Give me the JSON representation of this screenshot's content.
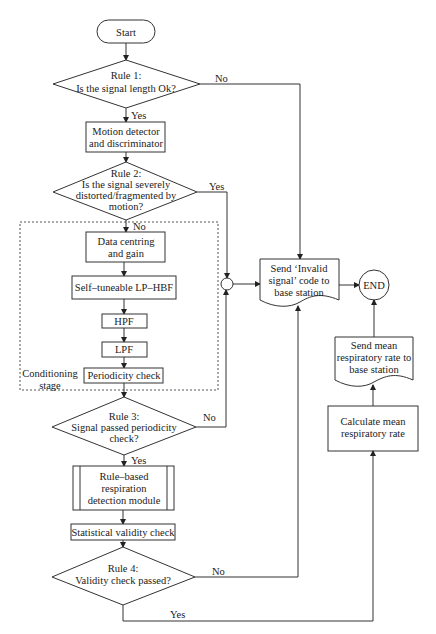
{
  "flowchart": {
    "start": {
      "label": "Start"
    },
    "rule1": {
      "title": "Rule 1:",
      "question": "Is the signal length Ok?",
      "yes": "Yes",
      "no": "No"
    },
    "motion": {
      "line1": "Motion detector",
      "line2": "and discriminator"
    },
    "rule2": {
      "title": "Rule 2:",
      "line1": "Is the signal severely",
      "line2": "distorted/fragmented by",
      "line3": "motion?",
      "yes": "Yes",
      "no": "No"
    },
    "conditioning": {
      "label_line1": "Conditioning",
      "label_line2": "stage",
      "centring": {
        "line1": "Data centring",
        "line2": "and gain"
      },
      "lphbf": "Self–tuneable LP–HBF",
      "hpf": "HPF",
      "lpf": "LPF",
      "periodicity": "Periodicity check"
    },
    "rule3": {
      "title": "Rule 3:",
      "line1": "Signal passed periodicity",
      "line2": "check?",
      "yes": "Yes",
      "no": "No"
    },
    "module": {
      "line1": "Rule–based",
      "line2": "respiration",
      "line3": "detection module"
    },
    "stat_check": "Statistical validity check",
    "rule4": {
      "title": "Rule 4:",
      "question": "Validity check passed?",
      "yes": "Yes",
      "no": "No"
    },
    "invalid": {
      "line1": "Send ‘Invalid",
      "line2": "signal’ code to",
      "line3": "base station"
    },
    "end": {
      "label": "END"
    },
    "send_mean": {
      "line1": "Send mean",
      "line2": "respiratory rate to",
      "line3": "base station"
    },
    "calc_mean": {
      "line1": "Calculate mean",
      "line2": "respiratory rate"
    }
  }
}
